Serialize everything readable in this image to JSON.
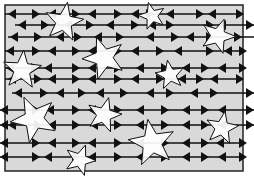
{
  "figure": {
    "colors": {
      "background": "#d9d9d9",
      "border": "#222222",
      "line": "#111111",
      "star_fill": "#ffffff",
      "star_stroke": "#111111",
      "page": "#ffffff"
    },
    "frame": {
      "x": 5,
      "y": 5,
      "w": 238,
      "h": 166
    },
    "rows": [
      {
        "y": 14,
        "x1": 5,
        "x2": 243
      },
      {
        "y": 25,
        "x1": 15,
        "x2": 254
      },
      {
        "y": 37,
        "x1": 8,
        "x2": 254
      },
      {
        "y": 51,
        "x1": 5,
        "x2": 243
      },
      {
        "y": 68,
        "x1": 5,
        "x2": 243
      },
      {
        "y": 79,
        "x1": 5,
        "x2": 243
      },
      {
        "y": 93,
        "x1": 12,
        "x2": 254
      },
      {
        "y": 110,
        "x1": 0,
        "x2": 254
      },
      {
        "y": 125,
        "x1": 0,
        "x2": 254
      },
      {
        "y": 143,
        "x1": 0,
        "x2": 243
      },
      {
        "y": 157,
        "x1": 0,
        "x2": 243
      }
    ],
    "markers": [
      [
        14,
        [
          12,
          "L"
        ],
        [
          36,
          "R"
        ],
        [
          52,
          "L"
        ],
        [
          76,
          "R"
        ],
        [
          92,
          "L"
        ],
        [
          118,
          "R"
        ],
        [
          135,
          "L"
        ],
        [
          150,
          "R"
        ],
        [
          170,
          "L"
        ],
        [
          200,
          "R"
        ],
        [
          212,
          "L"
        ],
        [
          240,
          "R"
        ]
      ],
      [
        25,
        [
          22,
          "L"
        ],
        [
          45,
          "R"
        ],
        [
          68,
          "L"
        ],
        [
          90,
          "R"
        ],
        [
          110,
          "L"
        ],
        [
          135,
          "R"
        ],
        [
          152,
          "L"
        ],
        [
          170,
          "R"
        ],
        [
          210,
          "R"
        ],
        [
          222,
          "L"
        ],
        [
          250,
          "R"
        ]
      ],
      [
        37,
        [
          14,
          "L"
        ],
        [
          38,
          "R"
        ],
        [
          60,
          "L"
        ],
        [
          78,
          "R"
        ],
        [
          98,
          "L"
        ],
        [
          120,
          "R"
        ],
        [
          150,
          "L"
        ],
        [
          175,
          "R"
        ],
        [
          190,
          "L"
        ],
        [
          210,
          "R"
        ],
        [
          238,
          "R"
        ]
      ],
      [
        51,
        [
          10,
          "L"
        ],
        [
          36,
          "R"
        ],
        [
          52,
          "L"
        ],
        [
          76,
          "R"
        ],
        [
          92,
          "L"
        ],
        [
          118,
          "R"
        ],
        [
          135,
          "L"
        ],
        [
          160,
          "R"
        ],
        [
          178,
          "L"
        ],
        [
          210,
          "R"
        ],
        [
          228,
          "L"
        ],
        [
          243,
          "R"
        ]
      ],
      [
        68,
        [
          10,
          "L"
        ],
        [
          35,
          "R"
        ],
        [
          48,
          "L"
        ],
        [
          76,
          "R"
        ],
        [
          92,
          "L"
        ],
        [
          118,
          "R"
        ],
        [
          140,
          "L"
        ],
        [
          165,
          "R"
        ],
        [
          186,
          "L"
        ],
        [
          205,
          "R"
        ],
        [
          222,
          "L"
        ],
        [
          243,
          "R"
        ]
      ],
      [
        79,
        [
          12,
          "L"
        ],
        [
          38,
          "R"
        ],
        [
          52,
          "L"
        ],
        [
          76,
          "R"
        ],
        [
          92,
          "L"
        ],
        [
          118,
          "R"
        ],
        [
          135,
          "L"
        ],
        [
          160,
          "R"
        ],
        [
          182,
          "L"
        ],
        [
          200,
          "R"
        ],
        [
          214,
          "L"
        ],
        [
          240,
          "R"
        ]
      ],
      [
        93,
        [
          18,
          "L"
        ],
        [
          44,
          "R"
        ],
        [
          60,
          "L"
        ],
        [
          82,
          "R"
        ],
        [
          100,
          "L"
        ],
        [
          124,
          "R"
        ],
        [
          150,
          "L"
        ],
        [
          170,
          "R"
        ],
        [
          194,
          "L"
        ],
        [
          214,
          "R"
        ],
        [
          250,
          "R"
        ]
      ],
      [
        110,
        [
          4,
          "L"
        ],
        [
          36,
          "R"
        ],
        [
          50,
          "L"
        ],
        [
          76,
          "R"
        ],
        [
          92,
          "L"
        ],
        [
          118,
          "R"
        ],
        [
          140,
          "L"
        ],
        [
          165,
          "R"
        ],
        [
          186,
          "L"
        ],
        [
          205,
          "R"
        ],
        [
          222,
          "L"
        ],
        [
          250,
          "R"
        ]
      ],
      [
        125,
        [
          4,
          "L"
        ],
        [
          12,
          "L"
        ],
        [
          38,
          "R"
        ],
        [
          52,
          "L"
        ],
        [
          76,
          "R"
        ],
        [
          94,
          "L"
        ],
        [
          118,
          "R"
        ],
        [
          140,
          "L"
        ],
        [
          165,
          "R"
        ],
        [
          186,
          "L"
        ],
        [
          205,
          "R"
        ],
        [
          222,
          "L"
        ],
        [
          250,
          "R"
        ]
      ],
      [
        143,
        [
          4,
          "L"
        ],
        [
          36,
          "R"
        ],
        [
          52,
          "L"
        ],
        [
          76,
          "R"
        ],
        [
          92,
          "L"
        ],
        [
          118,
          "R"
        ],
        [
          140,
          "L"
        ],
        [
          165,
          "R"
        ],
        [
          186,
          "L"
        ],
        [
          205,
          "R"
        ],
        [
          220,
          "L"
        ],
        [
          243,
          "R"
        ]
      ],
      [
        157,
        [
          4,
          "L"
        ],
        [
          36,
          "R"
        ],
        [
          48,
          "L"
        ],
        [
          76,
          "R"
        ],
        [
          92,
          "L"
        ],
        [
          118,
          "R"
        ],
        [
          140,
          "L"
        ],
        [
          165,
          "R"
        ],
        [
          186,
          "L"
        ],
        [
          205,
          "R"
        ],
        [
          222,
          "L"
        ],
        [
          243,
          "R"
        ]
      ]
    ],
    "stars": [
      {
        "cx": 64,
        "cy": 22,
        "r": 20,
        "rot": 10
      },
      {
        "cx": 152,
        "cy": 16,
        "r": 14,
        "rot": -15
      },
      {
        "cx": 218,
        "cy": 36,
        "r": 18,
        "rot": 20
      },
      {
        "cx": 104,
        "cy": 58,
        "r": 22,
        "rot": -20
      },
      {
        "cx": 22,
        "cy": 70,
        "r": 20,
        "rot": 5
      },
      {
        "cx": 170,
        "cy": 75,
        "r": 15,
        "rot": -10
      },
      {
        "cx": 34,
        "cy": 119,
        "r": 24,
        "rot": -25
      },
      {
        "cx": 104,
        "cy": 115,
        "r": 18,
        "rot": 15
      },
      {
        "cx": 222,
        "cy": 128,
        "r": 17,
        "rot": 10
      },
      {
        "cx": 152,
        "cy": 143,
        "r": 24,
        "rot": -10
      },
      {
        "cx": 80,
        "cy": 160,
        "r": 16,
        "rot": 20
      }
    ]
  }
}
